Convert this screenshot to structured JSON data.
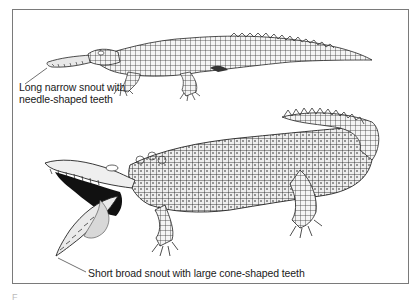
{
  "figure": {
    "labels": {
      "top": "Long narrow snout with needle-shaped teeth",
      "bottom": "Short broad snout with large cone-shaped teeth"
    },
    "caption_fragment": "F",
    "subjects": [
      {
        "name": "gharial-like crocodilian",
        "position": "top",
        "feature": "long narrow snout"
      },
      {
        "name": "crocodile with open jaws",
        "position": "bottom",
        "feature": "short broad snout"
      }
    ],
    "colors": {
      "ink": "#1a1a1a",
      "border": "#7a7a7a",
      "background": "#ffffff"
    }
  }
}
